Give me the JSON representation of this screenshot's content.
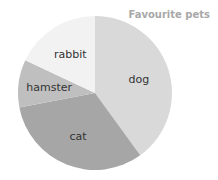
{
  "chart_data": {
    "type": "pie",
    "title": "Favourite pets",
    "categories": [
      "dog",
      "cat",
      "hamster",
      "rabbit"
    ],
    "values": [
      40,
      32,
      10,
      18
    ],
    "colors": [
      "#d9d9d9",
      "#a6a6a6",
      "#bfbfbf",
      "#f2f2f2"
    ],
    "start_angle": "12 o'clock",
    "direction": "clockwise",
    "legend": "none (labels inside slices)"
  }
}
